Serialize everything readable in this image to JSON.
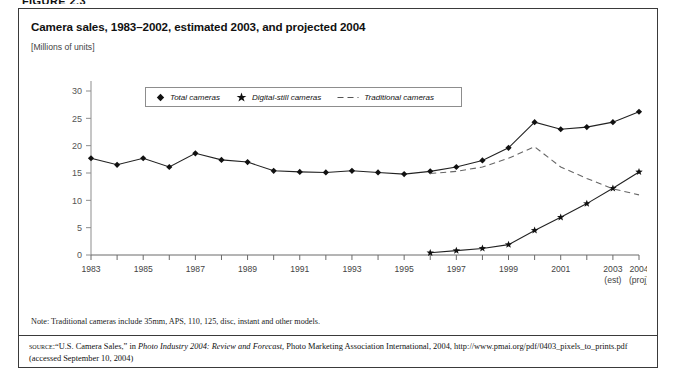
{
  "figure_caption": "FIGURE 2.3",
  "title": "Camera sales, 1983–2002, estimated 2003, and projected 2004",
  "subtitle": "[Millions of units]",
  "legend": {
    "items": [
      {
        "label": "Total cameras",
        "marker": "diamond-marker",
        "color": "#111111"
      },
      {
        "label": "Digital-still cameras",
        "marker": "star-marker",
        "color": "#111111"
      },
      {
        "label": "Traditional cameras",
        "marker": "dashed-line-marker",
        "color": "#555555"
      }
    ]
  },
  "note": "Note: Traditional cameras include 35mm, APS, 110, 125, disc, instant and other models.",
  "source": {
    "label": "source:",
    "text_1": "“U.S. Camera Sales,” in ",
    "italic": "Photo Industry 2004: Review and Forecast,",
    "text_2": " Photo Marketing Association International, 2004, http://www.pmai.org/pdf/0403_pixels_to_prints.pdf (accessed September 10, 2004)"
  },
  "chart_data": {
    "type": "line",
    "title": "Camera sales, 1983–2002, estimated 2003, and projected 2004",
    "xlabel": "",
    "ylabel": "Millions of units",
    "ylim": [
      0,
      30
    ],
    "yticks": [
      0,
      5,
      10,
      15,
      20,
      25,
      30
    ],
    "xlim": [
      1983,
      2004
    ],
    "xticks": [
      1983,
      1984,
      1985,
      1986,
      1987,
      1988,
      1989,
      1990,
      1991,
      1992,
      1993,
      1994,
      1995,
      1996,
      1997,
      1998,
      1999,
      2000,
      2001,
      2002,
      2003,
      2004
    ],
    "xticklabels": [
      "1983",
      "",
      "1985",
      "",
      "1987",
      "",
      "1989",
      "",
      "1991",
      "",
      "1993",
      "",
      "1995",
      "",
      "1997",
      "",
      "1999",
      "",
      "2001",
      "",
      "2003",
      "2004"
    ],
    "xtick_sublabels": {
      "2003": "(est)",
      "2004": "(proj)"
    },
    "grid": false,
    "legend_position": "top-center",
    "x": [
      1983,
      1984,
      1985,
      1986,
      1987,
      1988,
      1989,
      1990,
      1991,
      1992,
      1993,
      1994,
      1995,
      1996,
      1997,
      1998,
      1999,
      2000,
      2001,
      2002,
      2003,
      2004
    ],
    "series": [
      {
        "name": "Total cameras",
        "marker": "diamond",
        "style": "solid",
        "values": [
          17.7,
          16.5,
          17.7,
          16.1,
          18.6,
          17.4,
          17.0,
          15.4,
          15.2,
          15.1,
          15.4,
          15.1,
          14.8,
          15.3,
          16.1,
          17.3,
          19.6,
          24.3,
          23.0,
          23.4,
          24.3,
          26.2
        ]
      },
      {
        "name": "Digital-still cameras",
        "marker": "star",
        "style": "solid",
        "values": [
          null,
          null,
          null,
          null,
          null,
          null,
          null,
          null,
          null,
          null,
          null,
          null,
          null,
          0.4,
          0.8,
          1.2,
          1.9,
          4.5,
          6.9,
          9.4,
          12.2,
          15.2
        ]
      },
      {
        "name": "Traditional cameras",
        "marker": "none",
        "style": "dashed",
        "values": [
          null,
          null,
          null,
          null,
          null,
          null,
          null,
          null,
          null,
          null,
          null,
          null,
          null,
          14.9,
          15.3,
          16.1,
          17.7,
          19.8,
          16.1,
          14.0,
          12.1,
          11.0
        ]
      }
    ]
  }
}
